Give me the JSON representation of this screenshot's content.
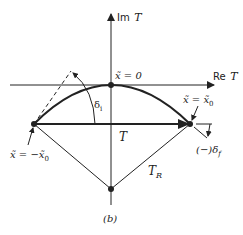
{
  "figure": {
    "caption": "(b)",
    "axes": {
      "imag_label_prefix": "Im",
      "imag_label_var": "T",
      "real_label_prefix": "Re",
      "real_label_var": "T"
    },
    "points": {
      "origin_label": "x̃ = 0",
      "right_label": "x̃ = x̃",
      "right_sub": "0",
      "left_label": "x̃ = −x̃",
      "left_sub": "0"
    },
    "vectors": {
      "T_label": "T",
      "TR_label": "T",
      "TR_sub": "R"
    },
    "angles": {
      "initial_label": "δ",
      "initial_sub": "i",
      "final_label": "(−)δ",
      "final_sub": "f"
    }
  },
  "colors": {
    "ink": "#222222",
    "background": "#ffffff"
  }
}
